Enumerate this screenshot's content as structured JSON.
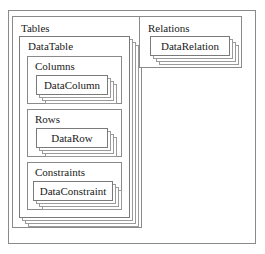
{
  "diagram": {
    "type": "nested-object-model",
    "root": {
      "name": "dataset",
      "title": "DataSet"
    },
    "collections": [
      {
        "name": "tables",
        "title": "Tables",
        "stacked_item": {
          "name": "datatable",
          "title": "DataTable",
          "stack_layers": 4,
          "subcollections": [
            {
              "name": "columns",
              "title": "Columns",
              "item": {
                "name": "datacolumn",
                "label": "DataColumn",
                "stack_layers": 3
              }
            },
            {
              "name": "rows",
              "title": "Rows",
              "item": {
                "name": "datarow",
                "label": "DataRow",
                "stack_layers": 3
              }
            },
            {
              "name": "constraints",
              "title": "Constraints",
              "item": {
                "name": "dataconstraint",
                "label": "DataConstraint",
                "stack_layers": 3
              }
            }
          ]
        }
      },
      {
        "name": "relations",
        "title": "Relations",
        "stacked_item": {
          "name": "datarelation",
          "label": "DataRelation",
          "stack_layers": 3
        }
      }
    ],
    "colors": {
      "background": "#ffffff",
      "border": "#8a8a8a",
      "stack_border": "#9a9a9a",
      "front_border": "#7a7a7a",
      "text": "#1a1a1a"
    }
  }
}
